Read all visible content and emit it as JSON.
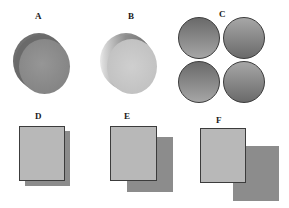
{
  "figure": {
    "panels": [
      {
        "id": "A",
        "label": "A",
        "shape": "cylinder",
        "front_color": "#8a8a8a",
        "back_color": "#6e6e6e"
      },
      {
        "id": "B",
        "label": "B",
        "shape": "cylinder",
        "front_color": "#c4c4c4",
        "back_color": "#7a7a7a"
      },
      {
        "id": "C",
        "label": "C",
        "shape": "four-circles",
        "colors": [
          "#6f6f6f",
          "#a8a8a8"
        ]
      },
      {
        "id": "D",
        "label": "D",
        "shape": "overlapping-rectangles",
        "offset": "small",
        "front_color": "#b5b5b5",
        "back_color": "#8c8c8c"
      },
      {
        "id": "E",
        "label": "E",
        "shape": "overlapping-rectangles",
        "offset": "medium",
        "front_color": "#b5b5b5",
        "back_color": "#8c8c8c"
      },
      {
        "id": "F",
        "label": "F",
        "shape": "overlapping-rectangles",
        "offset": "large",
        "front_color": "#b5b5b5",
        "back_color": "#8c8c8c"
      }
    ]
  }
}
